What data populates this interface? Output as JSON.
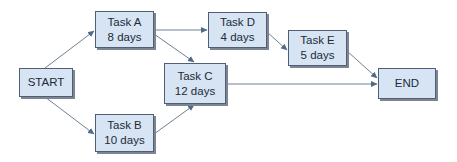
{
  "diagram": {
    "type": "network-activity-diagram",
    "nodes": [
      {
        "id": "start",
        "label": "START",
        "duration": ""
      },
      {
        "id": "taskA",
        "label": "Task A",
        "duration": "8 days"
      },
      {
        "id": "taskB",
        "label": "Task B",
        "duration": "10 days"
      },
      {
        "id": "taskC",
        "label": "Task C",
        "duration": "12 days"
      },
      {
        "id": "taskD",
        "label": "Task D",
        "duration": "4 days"
      },
      {
        "id": "taskE",
        "label": "Task E",
        "duration": "5 days"
      },
      {
        "id": "end",
        "label": "END",
        "duration": ""
      }
    ],
    "edges": [
      {
        "from": "start",
        "to": "taskA"
      },
      {
        "from": "start",
        "to": "taskB"
      },
      {
        "from": "taskA",
        "to": "taskD"
      },
      {
        "from": "taskA",
        "to": "taskC"
      },
      {
        "from": "taskB",
        "to": "taskC"
      },
      {
        "from": "taskD",
        "to": "taskE"
      },
      {
        "from": "taskE",
        "to": "end"
      },
      {
        "from": "taskC",
        "to": "end"
      }
    ],
    "colors": {
      "node_fill": "#d6e4f3",
      "node_border": "#4f5f74",
      "edge": "#6f8093",
      "text": "#1e2a36"
    }
  }
}
